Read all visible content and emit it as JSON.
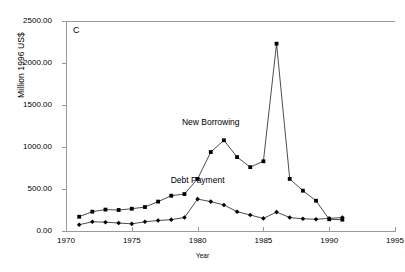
{
  "chart_data": {
    "type": "line",
    "title": "",
    "panel_label": "C",
    "xlabel": "Year",
    "ylabel": "Million 1996 US$",
    "xlim": [
      1970,
      1995
    ],
    "ylim": [
      0,
      2500
    ],
    "xticks": [
      "1970",
      "1975",
      "1980",
      "1985",
      "1990",
      "1995"
    ],
    "xtick_values": [
      1970,
      1975,
      1980,
      1985,
      1990,
      1995
    ],
    "yticks": [
      "0.00",
      "500.00",
      "1000.00",
      "1500.00",
      "2000.00",
      "2500.00"
    ],
    "ytick_values": [
      0,
      500,
      1000,
      1500,
      2000,
      2500
    ],
    "grid": false,
    "legend": "inline-annotations",
    "series": [
      {
        "name": "New Borrowing",
        "marker": "square",
        "color": "#000000",
        "label_x": 1981.0,
        "label_y": 1290,
        "x": [
          1971,
          1972,
          1973,
          1974,
          1975,
          1976,
          1977,
          1978,
          1979,
          1980,
          1981,
          1982,
          1983,
          1984,
          1985,
          1986,
          1987,
          1988,
          1989,
          1990,
          1991
        ],
        "values": [
          170,
          230,
          255,
          250,
          265,
          285,
          350,
          420,
          440,
          620,
          940,
          1080,
          880,
          760,
          830,
          2230,
          620,
          480,
          360,
          140,
          135
        ]
      },
      {
        "name": "Debt Payment",
        "marker": "diamond",
        "color": "#000000",
        "label_x": 1980.0,
        "label_y": 600,
        "x": [
          1971,
          1972,
          1973,
          1974,
          1975,
          1976,
          1977,
          1978,
          1979,
          1980,
          1981,
          1982,
          1983,
          1984,
          1985,
          1986,
          1987,
          1988,
          1989,
          1990,
          1991
        ],
        "values": [
          75,
          110,
          105,
          95,
          85,
          110,
          125,
          135,
          160,
          380,
          350,
          310,
          230,
          190,
          150,
          225,
          160,
          145,
          140,
          150,
          160
        ]
      }
    ]
  }
}
